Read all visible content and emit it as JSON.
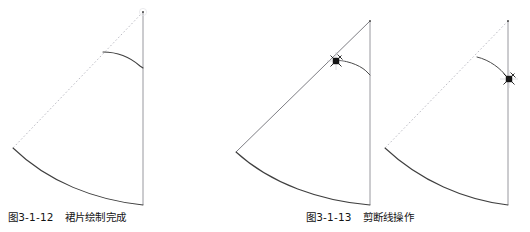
{
  "document": {
    "kind": "textbook-figure-pair",
    "background_color": "#ffffff",
    "width": 530,
    "height": 232
  },
  "styles": {
    "solid_line_color": "#4a4a4a",
    "dashed_line_color": "#b9b9c2",
    "cursor_color": "#1a1a1a",
    "caption_color": "#141414"
  },
  "figures": [
    {
      "id": "figure-3-1-12",
      "caption_number": "图3-1-12",
      "caption_title": "裙片绘制完成",
      "elements": [
        {
          "name": "apex-point",
          "type": "point",
          "x": 143,
          "y": 12
        },
        {
          "name": "center-radius-dashed-line",
          "type": "dashed-line",
          "x1": 143,
          "y1": 12,
          "x2": 13,
          "y2": 148
        },
        {
          "name": "center-front-vertical-line",
          "type": "solid-line",
          "x1": 143,
          "y1": 12,
          "x2": 143,
          "y2": 205
        },
        {
          "name": "waist-curve",
          "type": "curve",
          "from_x": 103,
          "from_y": 52,
          "to_x": 143,
          "to_y": 68
        },
        {
          "name": "hem-arc",
          "type": "arc",
          "from_x": 13,
          "from_y": 148,
          "to_x": 143,
          "to_y": 205
        }
      ]
    },
    {
      "id": "figure-3-1-13-before",
      "caption_number": "图3-1-13",
      "caption_title": "剪断线操作",
      "elements": [
        {
          "name": "apex-point",
          "type": "point",
          "x": 155,
          "y": 21
        },
        {
          "name": "center-radius-solid-line",
          "type": "solid-line",
          "x1": 155,
          "y1": 21,
          "x2": 21,
          "y2": 152
        },
        {
          "name": "center-front-vertical-line",
          "type": "solid-line",
          "x1": 155,
          "y1": 21,
          "x2": 155,
          "y2": 205
        },
        {
          "name": "waist-curve",
          "type": "curve",
          "from_x": 121,
          "from_y": 60,
          "to_x": 155,
          "to_y": 75
        },
        {
          "name": "hem-arc",
          "type": "arc",
          "from_x": 21,
          "from_y": 152,
          "to_x": 155,
          "to_y": 205
        },
        {
          "name": "pick-box-crosshair-cursor",
          "type": "cursor",
          "x": 121,
          "y": 61
        }
      ]
    },
    {
      "id": "figure-3-1-13-after",
      "caption_number": "",
      "caption_title": "",
      "elements": [
        {
          "name": "apex-point",
          "type": "point",
          "x": 128,
          "y": 21
        },
        {
          "name": "center-radius-dashed-line",
          "type": "dashed-line",
          "x1": 128,
          "y1": 21,
          "x2": 5,
          "y2": 148
        },
        {
          "name": "center-front-vertical-line",
          "type": "solid-line",
          "x1": 128,
          "y1": 21,
          "x2": 128,
          "y2": 205
        },
        {
          "name": "waist-curve",
          "type": "curve",
          "from_x": 97,
          "from_y": 57,
          "to_x": 128,
          "to_y": 78
        },
        {
          "name": "hem-arc",
          "type": "arc",
          "from_x": 5,
          "from_y": 148,
          "to_x": 128,
          "to_y": 205
        },
        {
          "name": "pick-box-crosshair-cursor",
          "type": "cursor",
          "x": 128,
          "y": 78
        }
      ]
    }
  ],
  "captions": {
    "caption_1": {
      "number": "图3-1-12",
      "title": "裙片绘制完成"
    },
    "caption_2": {
      "number": "图3-1-13",
      "title": "剪断线操作"
    }
  }
}
